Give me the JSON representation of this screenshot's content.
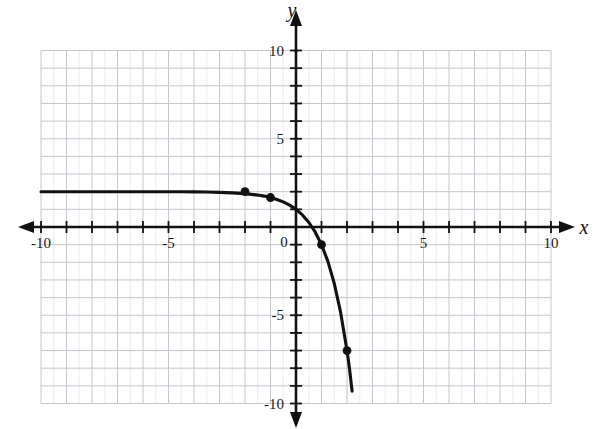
{
  "figure": {
    "kind": "coordinate-plane-graph",
    "background_color": "#ffffff",
    "curve_color": "#111111",
    "grid_color": "#c9c9cf",
    "grid_minor_color": "#dcdce2",
    "axis_color": "#111111",
    "point_color": "#111111"
  },
  "chart_data": {
    "type": "line",
    "title": "",
    "subtitle": "",
    "xlabel": "x",
    "ylabel": "y",
    "xlim": [
      -10,
      10
    ],
    "ylim": [
      -10,
      10
    ],
    "grid": true,
    "grid_step": 1,
    "legend": "none",
    "equation": "y = 2 - 3^x",
    "asymptote": {
      "type": "horizontal",
      "value": 2
    },
    "x_ticks": [
      -10,
      -5,
      0,
      5,
      10
    ],
    "x_tick_labels": [
      "-10",
      "-5",
      "0",
      "5",
      "10"
    ],
    "y_ticks": [
      -10,
      -5,
      0,
      5,
      10
    ],
    "y_tick_labels": [
      "10",
      "5",
      "0",
      "-5",
      "-10"
    ],
    "x_minor_tick_step": 1,
    "y_minor_tick_step": 1,
    "series": [
      {
        "name": "y = 2 - 3^x",
        "x": [
          -10,
          -9,
          -8,
          -7,
          -6,
          -5,
          -4.5,
          -4,
          -3.5,
          -3,
          -2.5,
          -2,
          -1.75,
          -1.5,
          -1.25,
          -1,
          -0.75,
          -0.5,
          -0.25,
          0,
          0.25,
          0.5,
          0.75,
          1,
          1.25,
          1.5,
          1.75,
          2,
          2.1,
          2.2
        ],
        "y": [
          2.0,
          2.0,
          2.0,
          2.0,
          1.999,
          1.996,
          1.993,
          1.988,
          1.979,
          1.963,
          1.936,
          1.889,
          1.85,
          1.808,
          1.75,
          1.667,
          1.561,
          1.423,
          1.24,
          1.0,
          0.684,
          0.268,
          -0.28,
          -1.0,
          -1.95,
          -3.196,
          -4.84,
          -7.0,
          -8.05,
          -9.3
        ],
        "marked_points": [
          {
            "x": -2,
            "y": 2
          },
          {
            "x": -1,
            "y": 1.67
          },
          {
            "x": 1,
            "y": -1
          },
          {
            "x": 2,
            "y": -7
          }
        ]
      }
    ]
  },
  "axes": {
    "x_axis_name": "x",
    "y_axis_name": "y",
    "origin_label": "0"
  }
}
